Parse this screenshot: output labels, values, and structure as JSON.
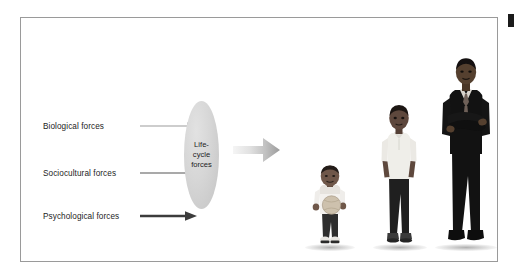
{
  "figure": {
    "frame_border_color": "#9a9a9a",
    "background_color": "#ffffff",
    "corner_mark_color": "#1b1b1b"
  },
  "forces": [
    {
      "label": "Biological forces",
      "arrow_color": "#bdbdbd",
      "arrow_weight": "light"
    },
    {
      "label": "Sociocultural forces",
      "arrow_color": "#8c8c8c",
      "arrow_weight": "medium"
    },
    {
      "label": "Psychological forces",
      "arrow_color": "#3c3c3c",
      "arrow_weight": "dark"
    }
  ],
  "lifecycle": {
    "text": "Life-\ncycle\nforces",
    "fill_color": "#d4d4d4"
  },
  "outcome_arrow": {
    "gradient_from": "#f2f2f2",
    "gradient_to": "#9b9b9b"
  },
  "people": [
    {
      "name": "toddler",
      "description": "Toddler in white t-shirt holding a ball",
      "shirt_color": "#f2f0ec",
      "pants_color": "#2c2c2c",
      "skin_color": "#6b5347",
      "ball_color": "#cbbfab"
    },
    {
      "name": "teen",
      "description": "Teenage boy in white polo shirt with hands in pockets",
      "shirt_color": "#efeee9",
      "pants_color": "#1f1f1f",
      "skin_color": "#5e483d"
    },
    {
      "name": "adult",
      "description": "Adult man in dark suit with tie, arms crossed",
      "suit_color": "#121212",
      "tie_color": "#6e6058",
      "shirt_color": "#d8d4cd",
      "skin_color": "#55402f"
    }
  ]
}
